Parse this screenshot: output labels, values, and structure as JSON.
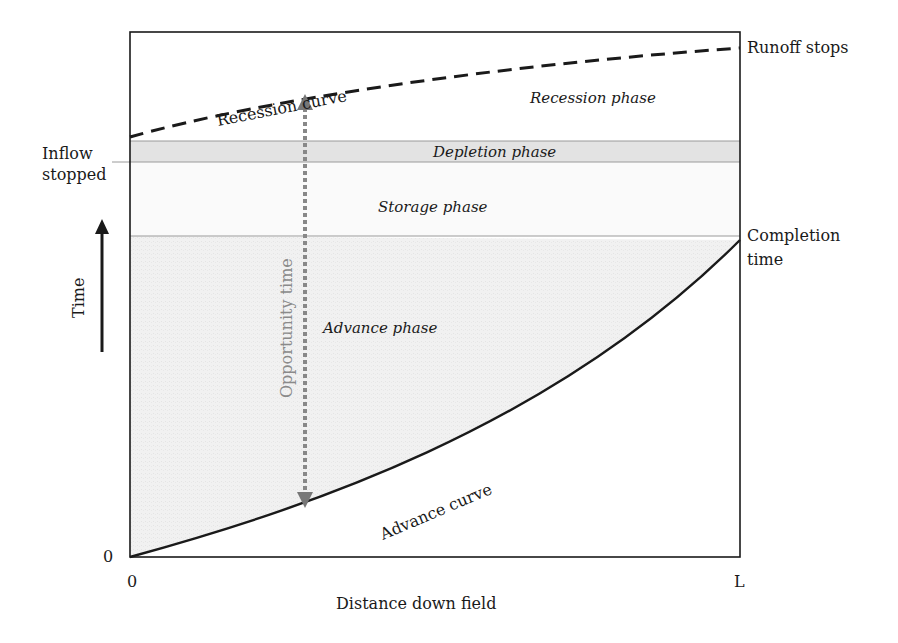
{
  "diagram": {
    "x_axis": {
      "label": "Distance down field",
      "start": "0",
      "end": "L"
    },
    "y_axis": {
      "label": "Time",
      "origin": "0"
    },
    "left_labels": {
      "inflow_stopped_line1": "Inflow",
      "inflow_stopped_line2": "stopped"
    },
    "right_labels": {
      "runoff_stops": "Runoff stops",
      "completion_line1": "Completion",
      "completion_line2": "time"
    },
    "curves": {
      "recession": "Recession curve",
      "advance": "Advance curve"
    },
    "phases": {
      "recession": "Recession phase",
      "depletion": "Depletion phase",
      "storage": "Storage phase",
      "advance": "Advance phase"
    },
    "opportunity_time": "Opportunity time",
    "colors": {
      "line": "#1a1a1a",
      "shade": "#eeeeee",
      "band": "#e2e2e2",
      "arrow": "#888888",
      "guide": "#9a9a9a"
    }
  }
}
